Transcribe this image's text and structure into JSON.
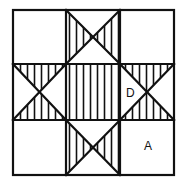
{
  "figure": {
    "stroke_color": "#111111",
    "background": "#ffffff",
    "outer": {
      "x0": 13,
      "y0": 10,
      "x1": 174,
      "y1": 175
    },
    "grid": {
      "xs": [
        13,
        66,
        120,
        174
      ],
      "ys": [
        10,
        64,
        120,
        175
      ]
    },
    "hatch_spacing": 7,
    "labels": [
      {
        "id": "D",
        "text": "D",
        "x": 126,
        "y": 87
      },
      {
        "id": "A",
        "text": "A",
        "x": 144,
        "y": 140
      }
    ]
  }
}
